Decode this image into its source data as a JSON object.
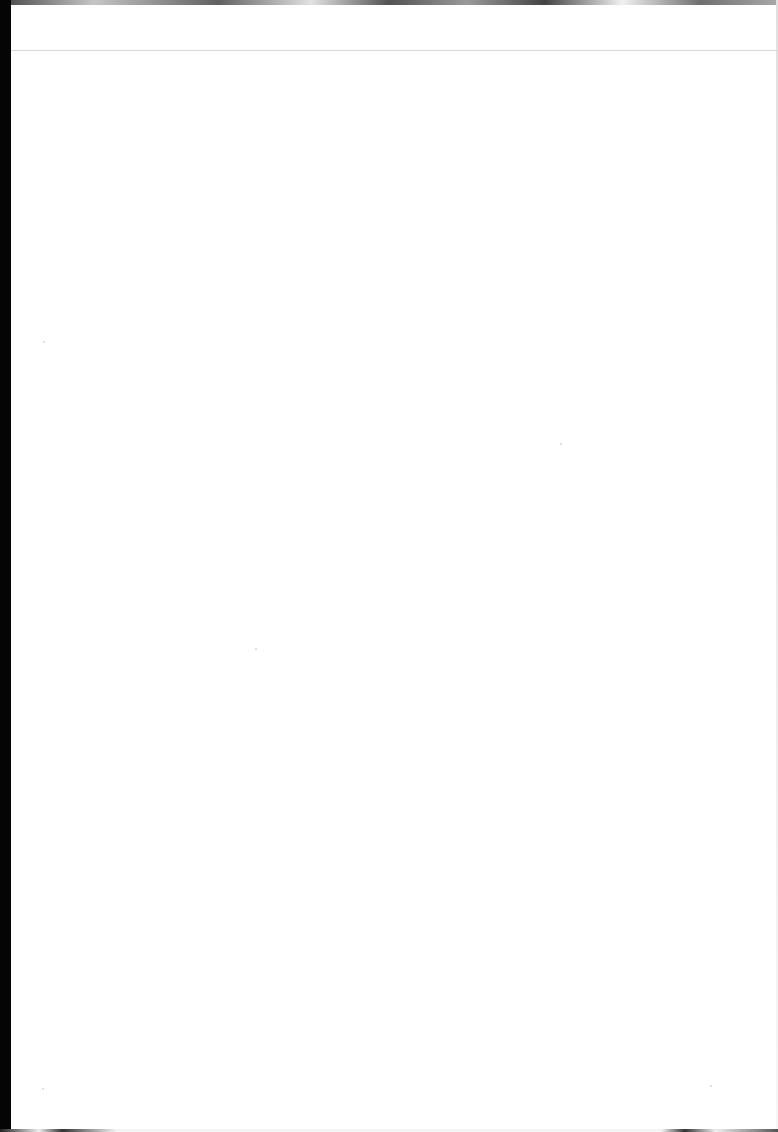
{
  "document": {
    "type": "scanned-page",
    "content": "blank",
    "text": "",
    "colors": {
      "paper": "#ffffff",
      "scan_edge": "#050505",
      "rule": "#d6d6d6"
    }
  }
}
